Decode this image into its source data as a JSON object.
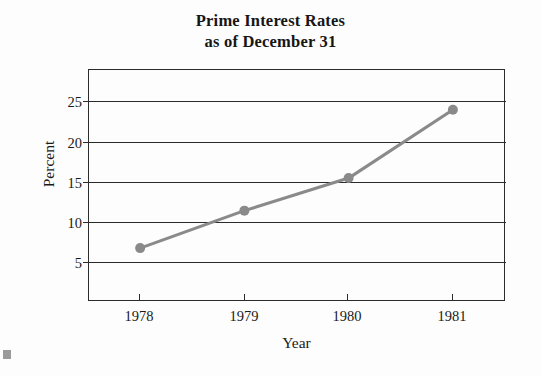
{
  "chart_data": {
    "type": "line",
    "title": "Prime Interest Rates as of December 31",
    "title_line1": "Prime Interest Rates",
    "title_line2": "as of December 31",
    "xlabel": "Year",
    "ylabel": "Percent",
    "categories": [
      "1978",
      "1979",
      "1980",
      "1981"
    ],
    "x": [
      1978,
      1979,
      1980,
      1981
    ],
    "values": [
      6.5,
      11.1,
      15.1,
      23.5
    ],
    "series": [
      {
        "name": "Prime Interest Rate",
        "values": [
          6.5,
          11.1,
          15.1,
          23.5
        ]
      }
    ],
    "ylim": [
      0,
      28.5
    ],
    "xlim": [
      1977.5,
      1981.5
    ],
    "yticks": [
      5,
      10,
      15,
      20,
      25
    ],
    "ytick_labels": [
      "5",
      "10",
      "15",
      "20",
      "25"
    ],
    "xtick_labels": [
      "1978",
      "1979",
      "1980",
      "1981"
    ],
    "grid": "horizontal",
    "legend": "none",
    "line_color": "#8a8a8a",
    "marker": "circle",
    "marker_color": "#8a8a8a",
    "axis_color": "#2b2b2b",
    "background_color": "#fdfdfd",
    "annotations": []
  },
  "figure": {
    "title_line1": "Prime Interest Rates",
    "title_line2": "as of December 31",
    "x_axis_title": "Year",
    "y_axis_title": "Percent",
    "y_tick_labels": [
      "25",
      "20",
      "15",
      "10",
      "5"
    ],
    "x_tick_labels": [
      "1978",
      "1979",
      "1980",
      "1981"
    ]
  }
}
